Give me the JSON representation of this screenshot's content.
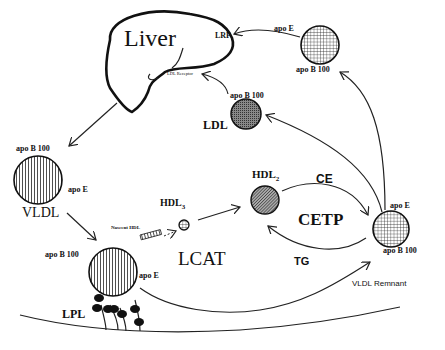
{
  "diagram": {
    "organ": {
      "label": "Liver",
      "receptors": {
        "lrp": "LRP",
        "ldl_receptor": "LDL Receptor"
      }
    },
    "particles": {
      "vldl": {
        "label": "VLDL",
        "apo_top": "apo B 100",
        "apo_side": "apo E"
      },
      "vldl_lpl": {
        "apo_top": "apo B 100",
        "apo_side": "apo E"
      },
      "ldl": {
        "label": "LDL",
        "apo_top": "apo B 100"
      },
      "idl_top": {
        "apo_top": "apo E",
        "apo_bottom": "apo B 100"
      },
      "vldl_remnant": {
        "label": "VLDL Remnant",
        "apo_top": "apo E",
        "apo_bottom": "apo B 100"
      },
      "nascent_hdl": {
        "label": "Nascent HDL"
      },
      "hdl3": {
        "label": "HDL",
        "subscript": "3"
      },
      "hdl2": {
        "label": "HDL",
        "subscript": "2"
      }
    },
    "enzymes": {
      "lcat": "LCAT",
      "cetp": "CETP",
      "lpl": "LPL"
    },
    "transfers": {
      "ce": "CE",
      "tg": "TG"
    }
  }
}
